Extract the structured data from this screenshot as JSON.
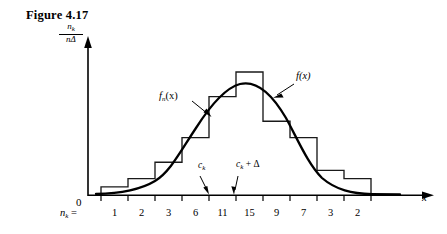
{
  "figure": {
    "caption": "Figure 4.17"
  },
  "axes": {
    "y_label_numerator": "n",
    "y_label_numerator_sub": "k",
    "y_label_denominator": "nΔ",
    "origin_label": "0",
    "x_label": "x"
  },
  "annotations": {
    "histogram_label": "f",
    "histogram_label_sub": "n",
    "histogram_label_arg": "(x)",
    "density_label": "f(x)",
    "bin_left_label": "c",
    "bin_left_sub": "k",
    "bin_right_label": "c",
    "bin_right_sub": "k",
    "bin_right_suffix": " + Δ"
  },
  "counts": {
    "legend": "n",
    "legend_sub": "k",
    "legend_eq": " =",
    "values": [
      "1",
      "2",
      "3",
      "6",
      "11",
      "15",
      "9",
      "7",
      "3",
      "2"
    ]
  },
  "colors": {
    "ink": "#000000",
    "background": "#ffffff",
    "histogram_stroke": "#1a1a1a",
    "curve_stroke": "#000000"
  },
  "chart_data": {
    "type": "bar",
    "title": "Figure 4.17",
    "xlabel": "x",
    "ylabel": "n_k / (nΔ)",
    "categories": [
      "1",
      "2",
      "3",
      "4",
      "5",
      "6",
      "7",
      "8",
      "9",
      "10"
    ],
    "values": [
      1,
      2,
      3,
      6,
      11,
      15,
      9,
      7,
      3,
      2
    ],
    "bin_labels": [
      "1",
      "2",
      "3",
      "6",
      "11",
      "15",
      "9",
      "7",
      "3",
      "2"
    ],
    "ylim": [
      0,
      15
    ],
    "grid": false,
    "legend": "none",
    "series": [
      {
        "name": "f_n(x)",
        "type": "bar",
        "values": [
          1,
          2,
          3,
          6,
          11,
          15,
          9,
          7,
          3,
          2
        ]
      },
      {
        "name": "f(x)",
        "type": "line",
        "description": "smooth normal density curve overlaying the histogram, peak near bin 6"
      }
    ],
    "annotations": [
      "f_n(x)",
      "f(x)",
      "c_k",
      "c_k + Δ"
    ]
  }
}
